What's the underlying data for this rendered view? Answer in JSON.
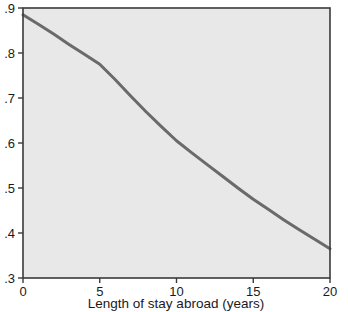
{
  "figure": {
    "background": "#ffffff",
    "plot_background": "#e8e8e8",
    "frame_color": "#3a3a3a",
    "line_color": "#6a6a6a",
    "partial_top_text": ""
  },
  "chart_data": {
    "type": "line",
    "title": "",
    "xlabel": "Length of stay abroad (years)",
    "ylabel": "",
    "xlim": [
      0,
      20
    ],
    "ylim": [
      0.3,
      0.9
    ],
    "xticks": [
      0,
      5,
      10,
      15,
      20
    ],
    "xticklabels": [
      "0",
      "5",
      "10",
      "15",
      "20"
    ],
    "yticks": [
      0.3,
      0.4,
      0.5,
      0.6,
      0.7,
      0.8,
      0.9
    ],
    "yticklabels": [
      ".3",
      ".4",
      ".5",
      ".6",
      ".7",
      ".8",
      ".9"
    ],
    "grid": false,
    "legend": null,
    "series": [
      {
        "name": "predicted probability",
        "color": "#6a6a6a",
        "x": [
          0,
          1,
          2,
          3,
          4,
          5,
          6,
          7,
          8,
          9,
          10,
          11,
          12,
          13,
          14,
          15,
          16,
          17,
          18,
          19,
          20
        ],
        "y": [
          0.885,
          0.864,
          0.842,
          0.819,
          0.797,
          0.775,
          0.741,
          0.705,
          0.67,
          0.637,
          0.605,
          0.578,
          0.552,
          0.526,
          0.5,
          0.475,
          0.452,
          0.429,
          0.407,
          0.386,
          0.365
        ]
      }
    ]
  }
}
